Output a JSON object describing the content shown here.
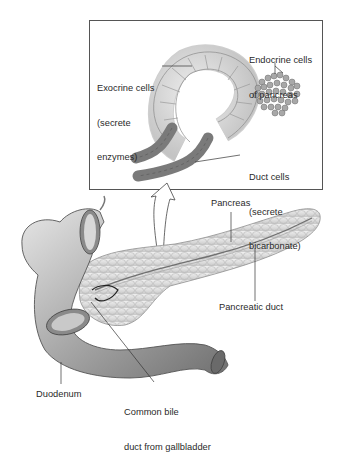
{
  "diagram": {
    "type": "anatomical-illustration",
    "inset": {
      "labels": {
        "exocrine": [
          "Exocrine cells",
          "(secrete",
          "enzymes)"
        ],
        "endocrine": [
          "Endocrine cells",
          "of pancreas"
        ],
        "duct_cells": [
          "Duct cells",
          "(secrete",
          "bicarbonate)"
        ]
      }
    },
    "main": {
      "labels": {
        "pancreas": "Pancreas",
        "pancreatic_duct": "Pancreatic duct",
        "duodenum": "Duodenum",
        "common_bile_duct": [
          "Common bile",
          "duct from gallbladder"
        ]
      }
    },
    "colors": {
      "outline": "#4a4a4a",
      "exocrine_fill": "#d9d9d9",
      "duct_fill": "#7a7a7a",
      "endocrine_fill": "#a8a8a8",
      "organ_fill": "#bdbdbd",
      "pancreas_fill": "#e2e2e2"
    }
  }
}
